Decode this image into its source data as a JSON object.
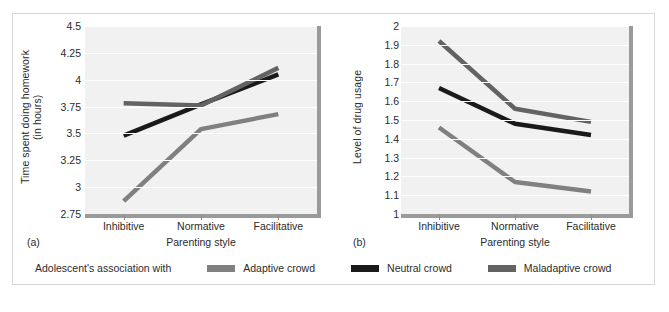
{
  "figure": {
    "panels": [
      {
        "tag": "(a)",
        "ylabel": "Time spent doing homework\n(in hours)",
        "xlabel": "Parenting style"
      },
      {
        "tag": "(b)",
        "ylabel": "Level of drug usage",
        "xlabel": "Parenting style"
      }
    ],
    "legend": {
      "title": "Adolescent's association with",
      "items": [
        {
          "label": "Adaptive crowd",
          "color": "#808080"
        },
        {
          "label": "Neutral crowd",
          "color": "#1a1a1a"
        },
        {
          "label": "Maladaptive crowd",
          "color": "#636363"
        }
      ]
    },
    "colors": {
      "plot_background": "#f1f1f1",
      "gridline": "#ffffff",
      "axis": "#9a9a9a",
      "frame": "#d7d7d7",
      "text": "#2b2b2b"
    }
  },
  "chart_data": [
    {
      "type": "line",
      "title": "(a)",
      "xlabel": "Parenting style",
      "ylabel": "Time spent doing homework (in hours)",
      "categories": [
        "Inhibitive",
        "Normative",
        "Facilitative"
      ],
      "ylim": [
        2.75,
        4.5
      ],
      "yticks": [
        2.75,
        3,
        3.25,
        3.5,
        3.75,
        4,
        4.25,
        4.5
      ],
      "ytick_labels": [
        "2.75",
        "3",
        "3.25",
        "3.5",
        "3.75",
        "4",
        "4.25",
        "4.5"
      ],
      "grid": true,
      "legend_position": "bottom",
      "series": [
        {
          "name": "Adaptive crowd",
          "color": "#808080",
          "values": [
            2.87,
            3.54,
            3.68
          ]
        },
        {
          "name": "Neutral crowd",
          "color": "#1a1a1a",
          "values": [
            3.48,
            3.77,
            4.05
          ]
        },
        {
          "name": "Maladaptive crowd",
          "color": "#636363",
          "values": [
            3.78,
            3.76,
            4.11
          ]
        }
      ]
    },
    {
      "type": "line",
      "title": "(b)",
      "xlabel": "Parenting style",
      "ylabel": "Level of drug usage",
      "categories": [
        "Inhibitive",
        "Normative",
        "Facilitative"
      ],
      "ylim": [
        1,
        2
      ],
      "yticks": [
        1,
        1.1,
        1.2,
        1.3,
        1.4,
        1.5,
        1.6,
        1.7,
        1.8,
        1.9,
        2
      ],
      "ytick_labels": [
        "1",
        "1.1",
        "1.2",
        "1.3",
        "1.4",
        "1.5",
        "1.6",
        "1.7",
        "1.8",
        "1.9",
        "2"
      ],
      "grid": true,
      "legend_position": "bottom",
      "series": [
        {
          "name": "Adaptive crowd",
          "color": "#808080",
          "values": [
            1.46,
            1.17,
            1.12
          ]
        },
        {
          "name": "Neutral crowd",
          "color": "#1a1a1a",
          "values": [
            1.67,
            1.48,
            1.42
          ]
        },
        {
          "name": "Maladaptive crowd",
          "color": "#636363",
          "values": [
            1.92,
            1.56,
            1.49
          ]
        }
      ]
    }
  ]
}
